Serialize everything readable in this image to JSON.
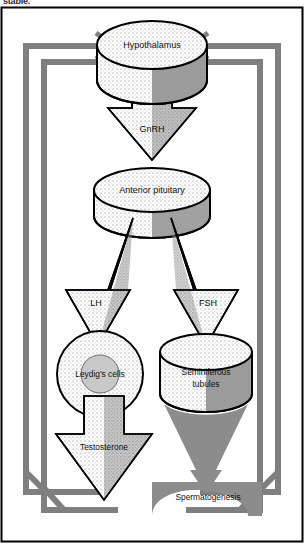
{
  "figure": {
    "type": "biological-flow-diagram",
    "title_fragment_top": "stable.",
    "border_color": "#000000",
    "feedback_loop_color": "#7f7f7f",
    "fill_light": "#f2f2f2",
    "fill_shadow": "#8c8c8c",
    "outline_color": "#000000"
  },
  "nodes": {
    "hypothalamus": {
      "label": "Hypothalamus",
      "shape": "cylinder"
    },
    "anterior_pituitary": {
      "label": "Anterior pituitary",
      "shape": "cylinder"
    },
    "leydig_cells": {
      "label": "Leydig's cells",
      "shape": "circle"
    },
    "seminiferous_tubules": {
      "label": "Seminiferous\ntubules",
      "line1": "Seminiferous",
      "line2": "tubules",
      "shape": "cylinder"
    },
    "spermatogenesis": {
      "label": "Spermatogenesis",
      "shape": "curved-band"
    }
  },
  "arrows": {
    "gnrh": {
      "label": "GnRH",
      "from": "hypothalamus",
      "to": "anterior_pituitary"
    },
    "lh": {
      "label": "LH",
      "from": "anterior_pituitary",
      "to": "leydig_cells"
    },
    "fsh": {
      "label": "FSH",
      "from": "anterior_pituitary",
      "to": "seminiferous_tubules"
    },
    "testosterone": {
      "label": "Testosterone",
      "from": "leydig_cells",
      "to": "feedback"
    }
  },
  "feedback": {
    "outer_loop": {
      "from": "spermatogenesis",
      "to": "hypothalamus",
      "color": "#7f7f7f"
    },
    "inner_loop": {
      "from": "testosterone",
      "to": "hypothalamus",
      "color": "#7f7f7f"
    }
  }
}
